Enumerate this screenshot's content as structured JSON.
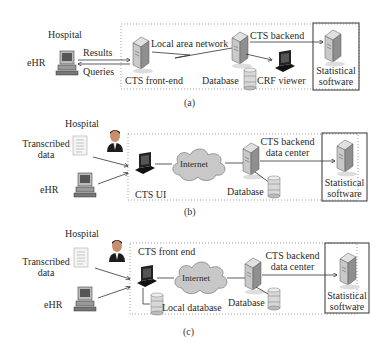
{
  "panels": [
    {
      "caption": "(a)",
      "hospital": "Hospital",
      "ehr": "eHR",
      "results": "Results",
      "queries": "Queries",
      "lan": "Local area network",
      "frontend": "CTS front-end",
      "backend": "CTS backend",
      "database": "Database",
      "crf_viewer": "CRF viewer",
      "stats_line1": "Statistical",
      "stats_line2": "software"
    },
    {
      "caption": "(b)",
      "hospital": "Hospital",
      "transcribed_line1": "Transcribed",
      "transcribed_line2": "data",
      "ehr": "eHR",
      "internet": "Internet",
      "ui": "CTS UI",
      "backend_line1": "CTS backend",
      "backend_line2": "data center",
      "database": "Database",
      "stats_line1": "Statistical",
      "stats_line2": "software"
    },
    {
      "caption": "(c)",
      "hospital": "Hospital",
      "transcribed_line1": "Transcribed",
      "transcribed_line2": "data",
      "ehr": "eHR",
      "frontend": "CTS front end",
      "internet": "Internet",
      "local_db": "Local database",
      "backend_line1": "CTS backend",
      "backend_line2": "data center",
      "database": "Database",
      "stats_line1": "Statistical",
      "stats_line2": "software"
    }
  ],
  "colors": {
    "line": "#333333",
    "dotted_border": "#777777",
    "cloud_fill": "#c8c8c8",
    "server_fill": "#b9b9b9"
  }
}
